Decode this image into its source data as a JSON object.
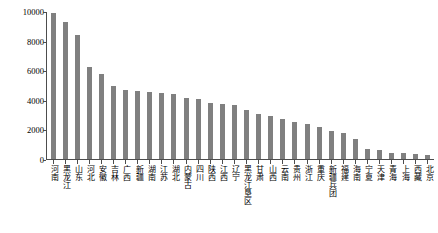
{
  "chart_data": {
    "type": "bar",
    "title": "",
    "xlabel": "",
    "ylabel": "籽粒产量（万t）",
    "ylim": [
      0,
      10000
    ],
    "ytick_values": [
      10000,
      8000,
      6000,
      4000,
      2000,
      0
    ],
    "ytick_labels": [
      "10000",
      "8000",
      "6000",
      "4000",
      "2000",
      "0"
    ],
    "grid": false,
    "legend": false,
    "bar_color": "#808080",
    "axis_color": "#4d4d4d",
    "categories": [
      "河南",
      "黑龙江",
      "山东",
      "河北",
      "安徽",
      "吉林",
      "广西",
      "新疆",
      "湖南",
      "江苏",
      "湖北",
      "内蒙古",
      "四川",
      "陕西",
      "江西",
      "辽宁",
      "黑龙江垦区",
      "甘肃",
      "山西",
      "云南",
      "贵州",
      "浙江",
      "重庆",
      "新疆兵团",
      "福建",
      "海南",
      "宁夏",
      "天津",
      "青海",
      "上海",
      "西藏",
      "北京"
    ],
    "values": [
      9900,
      9300,
      8450,
      6250,
      5800,
      5000,
      4700,
      4600,
      4550,
      4500,
      4400,
      4150,
      4050,
      3800,
      3750,
      3700,
      3350,
      3050,
      2950,
      2700,
      2500,
      2350,
      2200,
      1900,
      1750,
      1350,
      700,
      620,
      420,
      380,
      330,
      300
    ]
  }
}
